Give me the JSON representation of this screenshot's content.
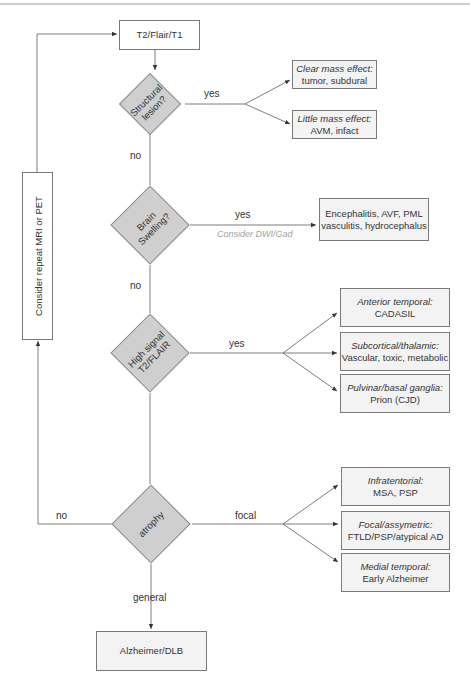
{
  "diagram": {
    "start": {
      "label": "T2/Flair/T1"
    },
    "decisions": [
      {
        "id": "structural",
        "label_lines": [
          "Structural",
          "lesion?"
        ]
      },
      {
        "id": "swelling",
        "label_lines": [
          "Brain",
          "Swelling?"
        ]
      },
      {
        "id": "high_signal",
        "label_lines": [
          "High signal",
          "T2/FLAIR"
        ]
      },
      {
        "id": "atrophy",
        "label_lines": [
          "atrophy"
        ]
      }
    ],
    "edges": {
      "structural_yes": "yes",
      "structural_no": "no",
      "swelling_yes": "yes",
      "swelling_hint": "Consider DWI/Gad",
      "swelling_no": "no",
      "high_signal_yes": "yes",
      "atrophy_focal": "focal",
      "atrophy_general": "general",
      "atrophy_no": "no"
    },
    "structural_outcomes": [
      {
        "title": "Clear mass effect:",
        "text": "tumor, subdural"
      },
      {
        "title": "Little mass effect:",
        "text": "AVM, infact"
      }
    ],
    "swelling_outcome": {
      "lines": [
        "Encephalitis, AVF, PML",
        "vasculitis, hydrocephalus"
      ]
    },
    "high_signal_outcomes": [
      {
        "title": "Anterior temporal:",
        "text": "CADASIL"
      },
      {
        "title": "Subcortical/thalamic:",
        "text": "Vascular, toxic, metabolic"
      },
      {
        "title": "Pulvinar/basal ganglia:",
        "text": "Prion (CJD)"
      }
    ],
    "atrophy_focal_outcomes": [
      {
        "title": "Infratentorial:",
        "text": "MSA, PSP"
      },
      {
        "title": "Focal/assymetric:",
        "text": "FTLD/PSP/atypical AD"
      },
      {
        "title": "Medial temporal:",
        "text": "Early Alzheimer"
      }
    ],
    "atrophy_general_outcome": {
      "label": "Alzheimer/DLB"
    },
    "loop_box": {
      "label": "Consider repeat MRI or PET"
    }
  },
  "colors": {
    "line": "#6e6e6e",
    "diamond_fill": "#cfcfcf",
    "box_fill": "#f3f3f3",
    "hint_text": "#a0a0a0"
  }
}
